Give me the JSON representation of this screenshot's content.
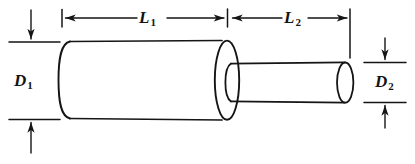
{
  "figure": {
    "background_color": "#ffffff",
    "line_color": "#151515"
  },
  "labels": {
    "length_1": {
      "symbol": "L",
      "subscript": "1"
    },
    "length_2": {
      "symbol": "L",
      "subscript": "2"
    },
    "diameter_1": {
      "symbol": "D",
      "subscript": "1"
    },
    "diameter_2": {
      "symbol": "D",
      "subscript": "2"
    }
  },
  "geometry": {
    "large_cylinder": {
      "left_x": 59,
      "right_x": 227,
      "top_y": 41,
      "bottom_y": 119,
      "ellipse_rx": 12,
      "ellipse_ry": 39
    },
    "small_cylinder": {
      "left_x": 227,
      "right_x": 350,
      "top_y": 63,
      "bottom_y": 102,
      "ellipse_rx": 8,
      "ellipse_ry": 19.5
    }
  },
  "dimensions": {
    "L1": {
      "from_x": 62,
      "to_x": 227,
      "y": 18,
      "orientation": "horizontal",
      "arrow_direction": "outward"
    },
    "L2": {
      "from_x": 229,
      "to_x": 350,
      "y": 18,
      "orientation": "horizontal",
      "arrow_direction": "outward"
    },
    "D1": {
      "from_y": 42,
      "to_y": 119,
      "x": 31,
      "orientation": "vertical",
      "arrow_direction": "inward"
    },
    "D2": {
      "from_y": 63,
      "to_y": 102,
      "x": 385,
      "orientation": "vertical",
      "arrow_direction": "inward"
    }
  }
}
